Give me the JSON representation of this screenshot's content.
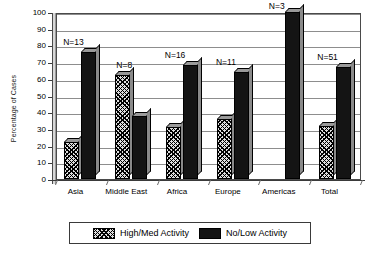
{
  "chart_data": {
    "type": "bar",
    "title": "",
    "subtitle": "",
    "xlabel": "",
    "ylabel": "Percentage of Cases",
    "ylim": [
      0,
      100
    ],
    "yticks": [
      0,
      10,
      20,
      30,
      40,
      50,
      60,
      70,
      80,
      90,
      100
    ],
    "ytick_labels": [
      "0",
      "10",
      "20",
      "30",
      "40",
      "50",
      "60",
      "70",
      "80",
      "90",
      "100"
    ],
    "grid": true,
    "legend_position": "bottom",
    "categories": [
      "Asia",
      "Middle East",
      "Africa",
      "Europe",
      "Americas",
      "Total"
    ],
    "series": [
      {
        "name": "High/Med Activity",
        "fill": "hatched",
        "color": "#2b2b2b",
        "values": [
          22,
          62,
          31,
          36,
          0,
          32
        ]
      },
      {
        "name": "No/Low Activity",
        "fill": "solid",
        "color": "#141414",
        "values": [
          76,
          38,
          68,
          64,
          100,
          67
        ]
      }
    ],
    "annotations": [
      {
        "text": "N=13",
        "category": "Asia"
      },
      {
        "text": "N=8",
        "category": "Middle East"
      },
      {
        "text": "N=16",
        "category": "Africa"
      },
      {
        "text": "N=11",
        "category": "Europe"
      },
      {
        "text": "N=3",
        "category": "Americas"
      },
      {
        "text": "N=51",
        "category": "Total"
      }
    ]
  },
  "legend": {
    "items": [
      {
        "label": "High/Med Activity",
        "swatch": "hatched-swatch"
      },
      {
        "label": "No/Low Activity",
        "swatch": "solid-swatch"
      }
    ]
  }
}
